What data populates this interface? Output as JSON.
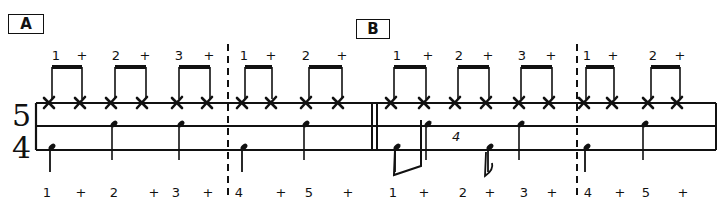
{
  "sections": [
    {
      "label": "A",
      "box": {
        "x": 8,
        "y": 14,
        "w": 34
      }
    },
    {
      "label": "B",
      "box": {
        "x": 356,
        "y": 19,
        "w": 32
      }
    }
  ],
  "time_signature": {
    "top": "5",
    "bottom": "4"
  },
  "staff": {
    "x1": 36,
    "x2": 716,
    "lines_y": [
      103,
      126,
      150
    ],
    "double_bar_x": [
      372,
      377
    ],
    "dashed_bars_x": [
      228,
      577
    ]
  },
  "hihat_counts": [
    {
      "text": "1",
      "x": 56
    },
    {
      "text": "+",
      "x": 82
    },
    {
      "text": "2",
      "x": 116
    },
    {
      "text": "+",
      "x": 145
    },
    {
      "text": "3",
      "x": 179
    },
    {
      "text": "+",
      "x": 209
    },
    {
      "text": "1",
      "x": 244
    },
    {
      "text": "+",
      "x": 271
    },
    {
      "text": "2",
      "x": 306
    },
    {
      "text": "+",
      "x": 342
    },
    {
      "text": "1",
      "x": 397
    },
    {
      "text": "+",
      "x": 428
    },
    {
      "text": "2",
      "x": 459
    },
    {
      "text": "+",
      "x": 488
    },
    {
      "text": "3",
      "x": 522
    },
    {
      "text": "+",
      "x": 551
    },
    {
      "text": "1",
      "x": 587
    },
    {
      "text": "+",
      "x": 613
    },
    {
      "text": "2",
      "x": 653
    },
    {
      "text": "+",
      "x": 680
    }
  ],
  "beamed_pairs_x": [
    [
      52,
      82
    ],
    [
      115,
      146
    ],
    [
      179,
      210
    ],
    [
      245,
      272
    ],
    [
      309,
      342
    ],
    [
      394,
      426
    ],
    [
      458,
      489
    ],
    [
      521,
      552
    ],
    [
      586,
      614
    ],
    [
      651,
      680
    ]
  ],
  "hihat_x_notes": [
    49,
    80,
    111,
    142,
    177,
    207,
    242,
    271,
    306,
    338,
    391,
    424,
    455,
    486,
    519,
    549,
    584,
    612,
    648,
    677
  ],
  "snare_notes": [
    {
      "x": 114
    },
    {
      "x": 181
    },
    {
      "x": 306
    },
    {
      "x": 428
    },
    {
      "x": 521
    },
    {
      "x": 645
    }
  ],
  "bass_notes": [
    {
      "x": 50
    },
    {
      "x": 242
    },
    {
      "x": 395
    },
    {
      "x": 488
    },
    {
      "x": 585
    }
  ],
  "annotation_4": {
    "text": "4",
    "x": 452,
    "y": 141
  },
  "bottom_counts": [
    {
      "text": "1",
      "x": 47
    },
    {
      "text": "+",
      "x": 81
    },
    {
      "text": "2",
      "x": 114
    },
    {
      "text": "+",
      "x": 154
    },
    {
      "text": "3",
      "x": 176
    },
    {
      "text": "+",
      "x": 208
    },
    {
      "text": "4",
      "x": 239
    },
    {
      "text": "+",
      "x": 281
    },
    {
      "text": "5",
      "x": 309
    },
    {
      "text": "+",
      "x": 348
    },
    {
      "text": "1",
      "x": 393
    },
    {
      "text": "+",
      "x": 424
    },
    {
      "text": "2",
      "x": 463
    },
    {
      "text": "+",
      "x": 490
    },
    {
      "text": "3",
      "x": 524
    },
    {
      "text": "+",
      "x": 552
    },
    {
      "text": "4",
      "x": 588
    },
    {
      "text": "+",
      "x": 620
    },
    {
      "text": "5",
      "x": 646
    },
    {
      "text": "+",
      "x": 683
    }
  ]
}
